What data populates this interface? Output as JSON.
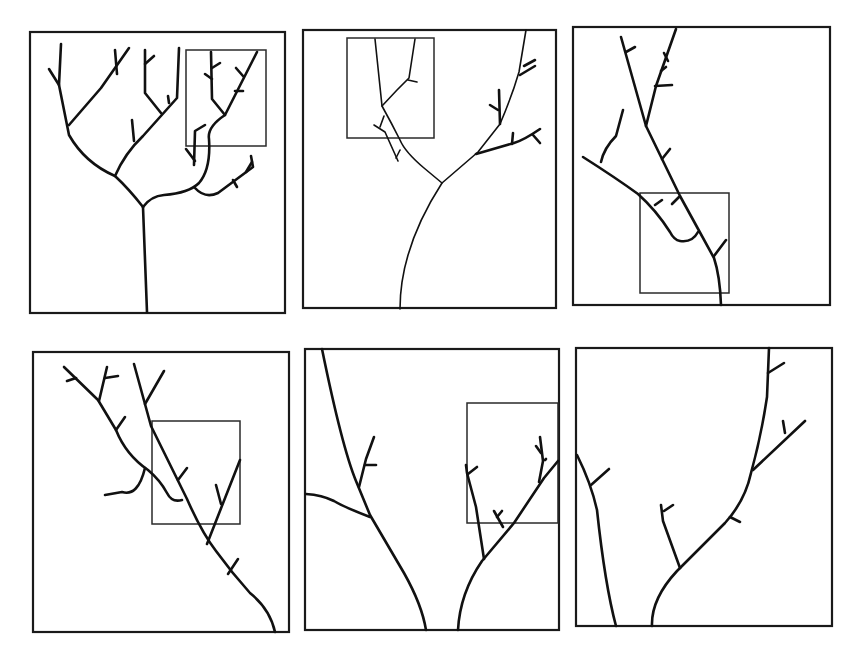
{
  "figure": {
    "colors": {
      "stroke": "#111111",
      "background": "#ffffff",
      "frame": "#1a1a1a"
    },
    "panels": [
      {
        "id": 1,
        "row": 1,
        "col": 1,
        "label": ""
      },
      {
        "id": 2,
        "row": 1,
        "col": 2,
        "label": ""
      },
      {
        "id": 3,
        "row": 1,
        "col": 3,
        "label": ""
      },
      {
        "id": 4,
        "row": 2,
        "col": 1,
        "label": ""
      },
      {
        "id": 5,
        "row": 2,
        "col": 2,
        "label": ""
      },
      {
        "id": 6,
        "row": 2,
        "col": 3,
        "label": ""
      }
    ]
  }
}
